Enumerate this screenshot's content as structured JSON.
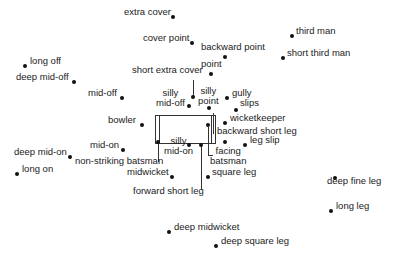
{
  "pitch": {
    "x": 155,
    "y": 115,
    "w": 59,
    "h": 27
  },
  "positions": [
    {
      "id": "extra-cover",
      "label": "extra cover",
      "dot": [
        173,
        17
      ],
      "text": [
        124,
        12
      ]
    },
    {
      "id": "cover-point",
      "label": "cover point",
      "dot": [
        192,
        43
      ],
      "text": [
        143,
        38
      ]
    },
    {
      "id": "backward-point",
      "label": "backward point",
      "dot": [
        225,
        57
      ],
      "text": [
        201,
        47
      ]
    },
    {
      "id": "point",
      "label": "point",
      "dot": [
        211,
        74
      ],
      "text": [
        201,
        64
      ]
    },
    {
      "id": "third-man",
      "label": "third man",
      "dot": [
        292,
        36
      ],
      "text": [
        296,
        31
      ]
    },
    {
      "id": "short-third-man",
      "label": "short third man",
      "dot": [
        283,
        58
      ],
      "text": [
        287,
        53
      ]
    },
    {
      "id": "long-off",
      "label": "long off",
      "dot": [
        25,
        66
      ],
      "text": [
        30,
        61
      ]
    },
    {
      "id": "deep-mid-off",
      "label": "deep mid-off",
      "dot": [
        74,
        82
      ],
      "text": [
        16,
        77
      ]
    },
    {
      "id": "short-extra-cover",
      "label": "short extra cover",
      "dot": [
        193,
        97
      ],
      "text": [
        132,
        70
      ]
    },
    {
      "id": "mid-off",
      "label": "mid-off",
      "dot": [
        122,
        98
      ],
      "text": [
        88,
        93
      ]
    },
    {
      "id": "silly-mid-off",
      "label": "silly mid-off",
      "label_lines": [
        "silly",
        "mid-off"
      ],
      "dot": [
        189,
        106
      ],
      "text": [
        156,
        93
      ]
    },
    {
      "id": "silly-point",
      "label": "silly point",
      "label_lines": [
        "silly",
        "point"
      ],
      "dot": [
        209,
        108
      ],
      "text": [
        198,
        91
      ]
    },
    {
      "id": "gully",
      "label": "gully",
      "dot": [
        227,
        98
      ],
      "text": [
        232,
        93
      ]
    },
    {
      "id": "slips",
      "label": "slips",
      "dot": [
        236,
        110
      ],
      "text": [
        240,
        103
      ]
    },
    {
      "id": "bowler",
      "label": "bowler",
      "dot": [
        142,
        125
      ],
      "text": [
        108,
        120
      ]
    },
    {
      "id": "wicketkeeper",
      "label": "wicketkeeper",
      "dot": [
        225,
        123
      ],
      "text": [
        230,
        118
      ]
    },
    {
      "id": "backward-short-leg",
      "label": "backward short leg",
      "dot": [
        225,
        142
      ],
      "text": [
        217,
        131
      ]
    },
    {
      "id": "leg-slip",
      "label": "leg slip",
      "dot": [
        245,
        145
      ],
      "text": [
        250,
        140
      ]
    },
    {
      "id": "facing-batsman",
      "label": "facing batsman",
      "label_lines": [
        "facing",
        "batsman"
      ],
      "dot": [
        208,
        125
      ],
      "text": [
        210,
        151
      ]
    },
    {
      "id": "mid-on",
      "label": "mid-on",
      "dot": [
        123,
        150
      ],
      "text": [
        90,
        145
      ]
    },
    {
      "id": "silly-mid-on",
      "label": "silly mid-on",
      "label_lines": [
        "silly",
        "mid-on"
      ],
      "dot": [
        189,
        145
      ],
      "text": [
        164,
        141
      ]
    },
    {
      "id": "deep-mid-on",
      "label": "deep mid-on",
      "dot": [
        70,
        157
      ],
      "text": [
        14,
        152
      ]
    },
    {
      "id": "non-striking-batsman",
      "label": "non-striking batsman",
      "dot": [
        158,
        142
      ],
      "text": [
        75,
        161
      ]
    },
    {
      "id": "long-on",
      "label": "long on",
      "dot": [
        17,
        174
      ],
      "text": [
        22,
        169
      ]
    },
    {
      "id": "midwicket",
      "label": "midwicket",
      "dot": [
        172,
        177
      ],
      "text": [
        127,
        172
      ]
    },
    {
      "id": "square-leg",
      "label": "square leg",
      "dot": [
        208,
        177
      ],
      "text": [
        212,
        172
      ]
    },
    {
      "id": "forward-short-leg",
      "label": "forward short leg",
      "dot": [
        201,
        145
      ],
      "text": [
        133,
        191
      ]
    },
    {
      "id": "deep-fine-leg",
      "label": "deep fine leg",
      "dot": [
        335,
        178
      ],
      "text": [
        327,
        181
      ]
    },
    {
      "id": "long-leg",
      "label": "long leg",
      "dot": [
        331,
        211
      ],
      "text": [
        336,
        206
      ]
    },
    {
      "id": "deep-midwicket",
      "label": "deep midwicket",
      "dot": [
        169,
        232
      ],
      "text": [
        174,
        227
      ]
    },
    {
      "id": "deep-square-leg",
      "label": "deep square leg",
      "dot": [
        216,
        246
      ],
      "text": [
        221,
        241
      ]
    }
  ],
  "connectors": [
    {
      "from": "short-extra-cover",
      "x": 193,
      "y1": 80,
      "y2": 97
    },
    {
      "from": "non-striking-batsman",
      "x": 158,
      "y1": 142,
      "y2": 162
    },
    {
      "from": "forward-short-leg",
      "x": 201,
      "y1": 145,
      "y2": 190
    },
    {
      "from": "backward-short-leg",
      "x": 213,
      "y1": 113,
      "y2": 134
    },
    {
      "from": "facing-batsman",
      "x": 208,
      "y1": 127,
      "y2": 155
    }
  ]
}
